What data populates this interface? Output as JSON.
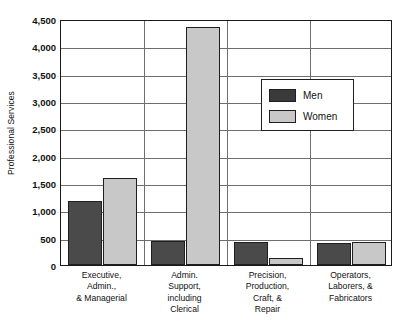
{
  "chart_data": {
    "type": "bar",
    "title": "",
    "xlabel": "",
    "ylabel": "Professional Services",
    "ylim": [
      0,
      4500
    ],
    "ytick_step": 500,
    "grid": true,
    "legend_position": "upper-right-inside",
    "categories": [
      [
        "Executive,",
        "Admin.,",
        "& Managerial"
      ],
      [
        "Admin.",
        "Support,",
        "including",
        "Clerical"
      ],
      [
        "Precision,",
        "Production,",
        "Craft, &",
        "Repair"
      ],
      [
        "Operators,",
        "Laborers, &",
        "Fabricators"
      ]
    ],
    "category_names": [
      "Executive, Admin., & Managerial",
      "Admin. Support, including Clerical",
      "Precision, Production, Craft, & Repair",
      "Operators, Laborers, & Fabricators"
    ],
    "series": [
      {
        "name": "Men",
        "color": "#4a4a4a",
        "values": [
          1170,
          440,
          420,
          400
        ]
      },
      {
        "name": "Women",
        "color": "#c8c8c8",
        "values": [
          1590,
          4350,
          130,
          420
        ]
      }
    ],
    "ytick_labels": [
      "0",
      "500",
      "1,000",
      "1,500",
      "2,000",
      "2,500",
      "3,000",
      "3,500",
      "4,000",
      "4,500"
    ],
    "ytick_values": [
      0,
      500,
      1000,
      1500,
      2000,
      2500,
      3000,
      3500,
      4000,
      4500
    ]
  },
  "legend": {
    "items": [
      {
        "label": "Men",
        "swatch": "men"
      },
      {
        "label": "Women",
        "swatch": "women"
      }
    ]
  }
}
